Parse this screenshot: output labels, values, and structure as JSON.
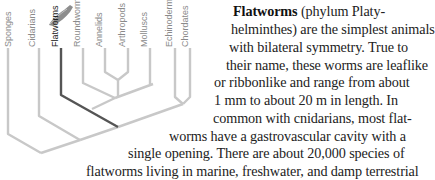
{
  "diagram": {
    "type": "phylogenetic-tree",
    "taxa": [
      "Sponges",
      "Cidarians",
      "Flatworms",
      "Roundworms",
      "Annelids",
      "Arthropods",
      "Molluscs",
      "Echinoderms",
      "Chordates"
    ],
    "highlighted": "Flatworms",
    "colors": {
      "branch": "#c8c8c8",
      "highlight": "#555555",
      "label": "#8a8a8a",
      "highlight_label": "#222222"
    },
    "icon": "flatworm-illustration"
  },
  "text": {
    "term": "Flatworms",
    "lines": [
      " (phylum Platy-",
      "helminthes) are the simplest animals",
      "with bilateral symmetry. True to",
      "their name, these worms are leaflike",
      "or ribbonlike and range from about",
      "1 mm to about 20 m in length. In",
      "common with cnidarians, most flat-",
      "worms have a gastrovascular cavity with a",
      "single opening. There are about 20,000 species of",
      "flatworms living in marine, freshwater, and damp terrestrial"
    ]
  }
}
